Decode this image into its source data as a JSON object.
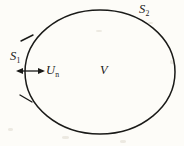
{
  "figure": {
    "background_color": "#fdfcf8",
    "ink_color": "#1a1a18",
    "labels": {
      "boundary_outer": {
        "symbol": "S",
        "subscript": "2",
        "text": "S2"
      },
      "boundary_segment": {
        "symbol": "S",
        "subscript": "1",
        "text": "S1"
      },
      "normal_velocity": {
        "symbol": "U",
        "subscript": "n",
        "text": "Un"
      },
      "volume": {
        "symbol": "V",
        "subscript": "",
        "text": "V"
      }
    },
    "shapes": {
      "ellipse": {
        "cx": 100,
        "cy": 72,
        "rx": 75,
        "ry": 62
      },
      "arrow": {
        "type": "double-headed-horizontal",
        "x1": 17,
        "x2": 44,
        "y": 71
      },
      "tick_marks": 2
    }
  }
}
